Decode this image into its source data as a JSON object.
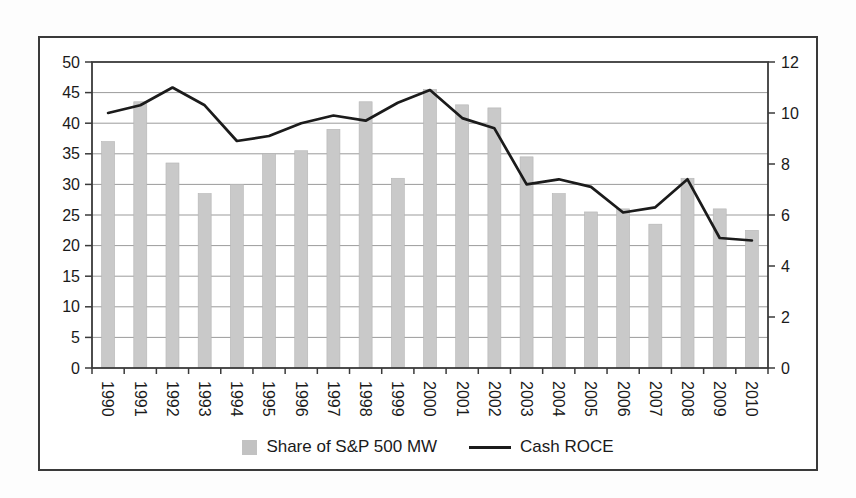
{
  "chart_data": {
    "type": "bar+line",
    "title": "",
    "categories": [
      "1990",
      "1991",
      "1992",
      "1993",
      "1994",
      "1995",
      "1996",
      "1997",
      "1998",
      "1999",
      "2000",
      "2001",
      "2002",
      "2003",
      "2004",
      "2005",
      "2006",
      "2007",
      "2008",
      "2009",
      "2010"
    ],
    "series": [
      {
        "name": "Share of S&P 500 MW",
        "type": "bar",
        "axis": "left",
        "color": "#c9c9c9",
        "values": [
          37,
          43.5,
          33.5,
          28.5,
          30,
          35,
          35.5,
          39,
          43.5,
          31,
          45.5,
          43,
          42.5,
          34.5,
          28.5,
          25.5,
          26,
          23.5,
          31,
          26,
          22.5
        ]
      },
      {
        "name": "Cash ROCE",
        "type": "line",
        "axis": "right",
        "color": "#1b1b1b",
        "values": [
          10.0,
          10.3,
          11.0,
          10.3,
          8.9,
          9.1,
          9.6,
          9.9,
          9.7,
          10.4,
          10.9,
          9.8,
          9.4,
          7.2,
          7.4,
          7.1,
          6.1,
          6.3,
          7.4,
          5.1,
          5.0
        ]
      }
    ],
    "left_axis": {
      "min": 0,
      "max": 50,
      "step": 5,
      "tick_labels": [
        "0",
        "5",
        "10",
        "15",
        "20",
        "25",
        "30",
        "35",
        "40",
        "45",
        "50"
      ]
    },
    "right_axis": {
      "min": 0,
      "max": 12,
      "step": 2,
      "tick_labels": [
        "0",
        "2",
        "4",
        "6",
        "8",
        "10",
        "12"
      ]
    },
    "grid": true,
    "x_labels_rotated_deg": 90,
    "legend_position": "bottom-center"
  },
  "legend": {
    "bar_label": "Share of S&P 500 MW",
    "line_label": "Cash ROCE"
  },
  "colors": {
    "bar_fill": "#c9c9c9",
    "line_stroke": "#1b1b1b",
    "gridline": "#9b9b9b",
    "axis": "#3a3a3a",
    "text": "#1a1a1a",
    "frame_border": "#3a3a3a",
    "plot_background": "#ffffff",
    "page_background": "#fdfdfd"
  }
}
